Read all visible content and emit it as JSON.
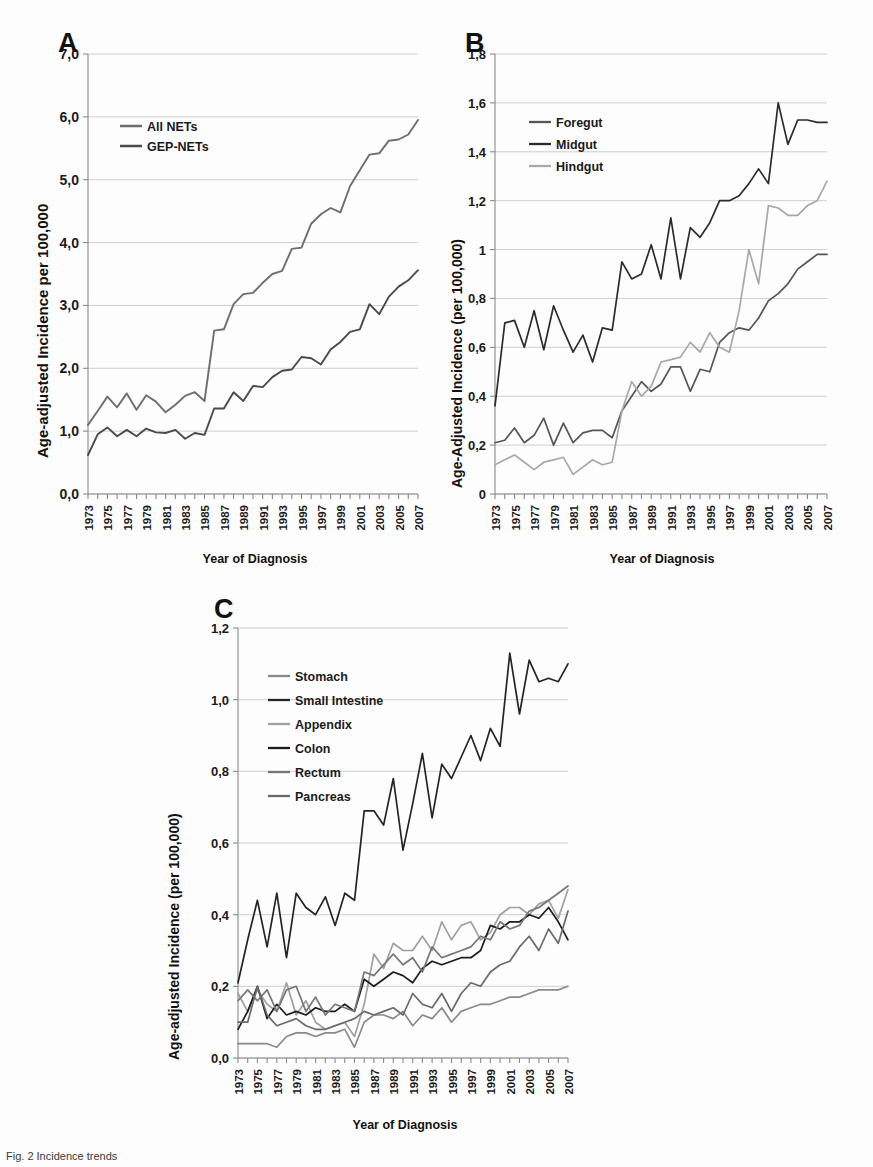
{
  "figure": {
    "caption": "Fig. 2  Incidence trends",
    "xlabel": "Year of Diagnosis",
    "panel_letters": {
      "a": "A",
      "b": "B",
      "c": "C"
    },
    "years": [
      1973,
      1974,
      1975,
      1976,
      1977,
      1978,
      1979,
      1980,
      1981,
      1982,
      1983,
      1984,
      1985,
      1986,
      1987,
      1988,
      1989,
      1990,
      1991,
      1992,
      1993,
      1994,
      1995,
      1996,
      1997,
      1998,
      1999,
      2000,
      2001,
      2002,
      2003,
      2004,
      2005,
      2006,
      2007
    ],
    "year_ticks_labeled": [
      1973,
      1975,
      1977,
      1979,
      1981,
      1983,
      1985,
      1987,
      1989,
      1991,
      1993,
      1995,
      1997,
      1999,
      2001,
      2003,
      2005,
      2007
    ]
  },
  "colors": {
    "all_nets": "#6e6e6e",
    "gep_nets": "#4a4a4a",
    "foregut": "#555555",
    "midgut": "#2b2b2b",
    "hindgut": "#a8a8a8",
    "stomach": "#8a8a8a",
    "small_intestine": "#242424",
    "appendix": "#a0a0a0",
    "colon": "#1c1c1c",
    "rectum": "#777777",
    "pancreas": "#6a6a6a",
    "grid": "#c9c9c9",
    "axis": "#8a8a8a"
  },
  "chart_data": [
    {
      "id": "A",
      "type": "line",
      "title": "A",
      "xlabel": "Year of Diagnosis",
      "ylabel": "Age-adjusted Incidence per 100,000",
      "ylim": [
        0.0,
        7.0
      ],
      "ytick_labels": [
        "0,0",
        "1,0",
        "2,0",
        "3,0",
        "4,0",
        "5,0",
        "6,0",
        "7,0"
      ],
      "ytick_values": [
        0,
        1,
        2,
        3,
        4,
        5,
        6,
        7
      ],
      "grid": true,
      "legend_position": "upper-left",
      "x": [
        1973,
        1974,
        1975,
        1976,
        1977,
        1978,
        1979,
        1980,
        1981,
        1982,
        1983,
        1984,
        1985,
        1986,
        1987,
        1988,
        1989,
        1990,
        1991,
        1992,
        1993,
        1994,
        1995,
        1996,
        1997,
        1998,
        1999,
        2000,
        2001,
        2002,
        2003,
        2004,
        2005,
        2006,
        2007
      ],
      "series": [
        {
          "name": "All NETs",
          "color": "#6e6e6e",
          "values": [
            1.1,
            1.32,
            1.55,
            1.38,
            1.6,
            1.34,
            1.57,
            1.47,
            1.3,
            1.42,
            1.56,
            1.62,
            1.48,
            2.6,
            2.62,
            3.02,
            3.18,
            3.2,
            3.36,
            3.5,
            3.55,
            3.9,
            3.92,
            4.3,
            4.45,
            4.55,
            4.48,
            4.9,
            5.15,
            5.4,
            5.42,
            5.62,
            5.64,
            5.72,
            5.95
          ]
        },
        {
          "name": "GEP-NETs",
          "color": "#4a4a4a",
          "values": [
            0.62,
            0.95,
            1.06,
            0.92,
            1.02,
            0.92,
            1.04,
            0.98,
            0.97,
            1.02,
            0.88,
            0.97,
            0.94,
            1.36,
            1.36,
            1.62,
            1.48,
            1.72,
            1.7,
            1.86,
            1.96,
            1.98,
            2.18,
            2.16,
            2.06,
            2.3,
            2.42,
            2.58,
            2.62,
            3.02,
            2.86,
            3.14,
            3.3,
            3.4,
            3.56
          ]
        }
      ]
    },
    {
      "id": "B",
      "type": "line",
      "title": "B",
      "xlabel": "Year of Diagnosis",
      "ylabel": "Age-Adjusted Incidence (per 100,000)",
      "ylim": [
        0.0,
        1.8
      ],
      "ytick_labels": [
        "0",
        "0,2",
        "0,4",
        "0,6",
        "0,8",
        "1",
        "1,2",
        "1,4",
        "1,6",
        "1,8"
      ],
      "ytick_values": [
        0,
        0.2,
        0.4,
        0.6,
        0.8,
        1.0,
        1.2,
        1.4,
        1.6,
        1.8
      ],
      "grid": true,
      "legend_position": "upper-left",
      "x": [
        1973,
        1974,
        1975,
        1976,
        1977,
        1978,
        1979,
        1980,
        1981,
        1982,
        1983,
        1984,
        1985,
        1986,
        1987,
        1988,
        1989,
        1990,
        1991,
        1992,
        1993,
        1994,
        1995,
        1996,
        1997,
        1998,
        1999,
        2000,
        2001,
        2002,
        2003,
        2004,
        2005,
        2006,
        2007
      ],
      "series": [
        {
          "name": "Foregut",
          "color": "#555555",
          "values": [
            0.21,
            0.22,
            0.27,
            0.21,
            0.24,
            0.31,
            0.2,
            0.29,
            0.21,
            0.25,
            0.26,
            0.26,
            0.23,
            0.34,
            0.4,
            0.46,
            0.42,
            0.45,
            0.52,
            0.52,
            0.42,
            0.51,
            0.5,
            0.62,
            0.66,
            0.68,
            0.67,
            0.72,
            0.79,
            0.82,
            0.86,
            0.92,
            0.95,
            0.98,
            0.98
          ]
        },
        {
          "name": "Midgut",
          "color": "#2b2b2b",
          "values": [
            0.36,
            0.7,
            0.71,
            0.6,
            0.75,
            0.59,
            0.77,
            0.67,
            0.58,
            0.65,
            0.54,
            0.68,
            0.67,
            0.95,
            0.88,
            0.9,
            1.02,
            0.88,
            1.13,
            0.88,
            1.09,
            1.05,
            1.11,
            1.2,
            1.2,
            1.22,
            1.27,
            1.33,
            1.27,
            1.6,
            1.43,
            1.53,
            1.53,
            1.52,
            1.52
          ]
        },
        {
          "name": "Hindgut",
          "color": "#a8a8a8",
          "values": [
            0.12,
            0.14,
            0.16,
            0.13,
            0.1,
            0.13,
            0.14,
            0.15,
            0.08,
            0.11,
            0.14,
            0.12,
            0.13,
            0.34,
            0.46,
            0.4,
            0.44,
            0.54,
            0.55,
            0.56,
            0.62,
            0.58,
            0.66,
            0.6,
            0.58,
            0.75,
            1.0,
            0.86,
            1.18,
            1.17,
            1.14,
            1.14,
            1.18,
            1.2,
            1.28
          ]
        }
      ]
    },
    {
      "id": "C",
      "type": "line",
      "title": "C",
      "xlabel": "Year of Diagnosis",
      "ylabel": "Age-adjusted Incidence (per 100,000)",
      "ylim": [
        0.0,
        1.2
      ],
      "ytick_labels": [
        "0,0",
        "0,2",
        "0,4",
        "0,6",
        "0,8",
        "1,0",
        "1,2"
      ],
      "ytick_values": [
        0,
        0.2,
        0.4,
        0.6,
        0.8,
        1.0,
        1.2
      ],
      "grid": true,
      "legend_position": "upper-left",
      "x": [
        1973,
        1974,
        1975,
        1976,
        1977,
        1978,
        1979,
        1980,
        1981,
        1982,
        1983,
        1984,
        1985,
        1986,
        1987,
        1988,
        1989,
        1990,
        1991,
        1992,
        1993,
        1994,
        1995,
        1996,
        1997,
        1998,
        1999,
        2000,
        2001,
        2002,
        2003,
        2004,
        2005,
        2006,
        2007
      ],
      "series": [
        {
          "name": "Stomach",
          "color": "#8a8a8a",
          "values": [
            0.04,
            0.04,
            0.04,
            0.04,
            0.03,
            0.06,
            0.07,
            0.07,
            0.06,
            0.07,
            0.07,
            0.08,
            0.03,
            0.1,
            0.12,
            0.12,
            0.11,
            0.13,
            0.09,
            0.12,
            0.11,
            0.14,
            0.1,
            0.13,
            0.14,
            0.15,
            0.15,
            0.16,
            0.17,
            0.17,
            0.18,
            0.19,
            0.19,
            0.19,
            0.2
          ]
        },
        {
          "name": "Small Intestine",
          "color": "#242424",
          "values": [
            0.21,
            0.33,
            0.44,
            0.31,
            0.46,
            0.28,
            0.46,
            0.42,
            0.4,
            0.45,
            0.37,
            0.46,
            0.44,
            0.69,
            0.69,
            0.65,
            0.78,
            0.58,
            0.71,
            0.85,
            0.67,
            0.82,
            0.78,
            0.84,
            0.9,
            0.83,
            0.92,
            0.87,
            1.13,
            0.96,
            1.11,
            1.05,
            1.06,
            1.05,
            1.1
          ]
        },
        {
          "name": "Appendix",
          "color": "#a0a0a0",
          "values": [
            0.18,
            0.13,
            0.19,
            0.15,
            0.13,
            0.21,
            0.12,
            0.16,
            0.1,
            0.08,
            0.09,
            0.1,
            0.06,
            0.15,
            0.29,
            0.25,
            0.32,
            0.3,
            0.3,
            0.34,
            0.3,
            0.38,
            0.33,
            0.37,
            0.38,
            0.33,
            0.35,
            0.4,
            0.42,
            0.42,
            0.4,
            0.43,
            0.44,
            0.39,
            0.47
          ]
        },
        {
          "name": "Colon",
          "color": "#1c1c1c",
          "values": [
            0.08,
            0.13,
            0.2,
            0.11,
            0.15,
            0.12,
            0.13,
            0.12,
            0.14,
            0.13,
            0.13,
            0.15,
            0.13,
            0.22,
            0.2,
            0.22,
            0.24,
            0.23,
            0.21,
            0.25,
            0.27,
            0.26,
            0.27,
            0.28,
            0.28,
            0.3,
            0.37,
            0.36,
            0.38,
            0.38,
            0.4,
            0.39,
            0.42,
            0.38,
            0.33
          ]
        },
        {
          "name": "Rectum",
          "color": "#777777",
          "values": [
            0.16,
            0.19,
            0.16,
            0.19,
            0.13,
            0.19,
            0.2,
            0.13,
            0.17,
            0.12,
            0.15,
            0.14,
            0.13,
            0.24,
            0.23,
            0.26,
            0.29,
            0.26,
            0.28,
            0.24,
            0.31,
            0.28,
            0.29,
            0.3,
            0.31,
            0.34,
            0.33,
            0.38,
            0.36,
            0.37,
            0.41,
            0.42,
            0.44,
            0.46,
            0.48
          ]
        },
        {
          "name": "Pancreas",
          "color": "#6a6a6a",
          "values": [
            0.1,
            0.1,
            0.2,
            0.12,
            0.09,
            0.1,
            0.11,
            0.09,
            0.08,
            0.08,
            0.09,
            0.1,
            0.11,
            0.13,
            0.12,
            0.13,
            0.14,
            0.12,
            0.18,
            0.15,
            0.14,
            0.18,
            0.13,
            0.18,
            0.21,
            0.2,
            0.24,
            0.26,
            0.27,
            0.31,
            0.34,
            0.3,
            0.36,
            0.32,
            0.41
          ]
        }
      ]
    }
  ]
}
